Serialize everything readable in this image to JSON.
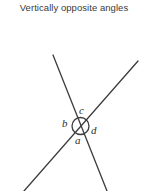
{
  "page": {
    "width": 148,
    "height": 191,
    "background_color": "#ffffff"
  },
  "title": {
    "text": "Vertically opposite angles",
    "color": "#3a3a3a"
  },
  "diagram": {
    "name": "vertically-opposite-angles-diagram",
    "stroke_color": "#3c3c3c",
    "line_width": 1.3,
    "intersection": {
      "center_x": 80.5,
      "center_y": 126,
      "circle_radius": 8.5,
      "circle_stroke_color": "#3c3c3c"
    },
    "lines": [
      {
        "name": "line-upper-left-to-lower-right",
        "x1": 53,
        "y1": 55,
        "x2": 107,
        "y2": 191
      },
      {
        "name": "line-lower-left-to-upper-right",
        "x1": 24,
        "y1": 191,
        "x2": 138,
        "y2": 61
      }
    ],
    "angle_labels": [
      {
        "id": "a",
        "text": "a",
        "position": "bottom",
        "x": 78,
        "y": 141
      },
      {
        "id": "b",
        "text": "b",
        "position": "left",
        "x": 66,
        "y": 124
      },
      {
        "id": "c",
        "text": "c",
        "position": "top",
        "x": 82,
        "y": 111
      },
      {
        "id": "d",
        "text": "d",
        "position": "right",
        "x": 94,
        "y": 131
      }
    ]
  }
}
